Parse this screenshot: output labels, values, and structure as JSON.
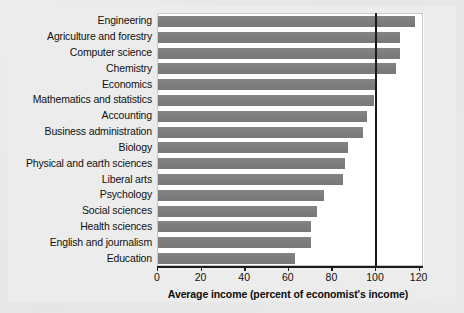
{
  "chart_data": {
    "type": "bar",
    "orientation": "horizontal",
    "title": "",
    "xlabel": "Average income (percent of economist's income)",
    "ylabel": "",
    "xlim": [
      0,
      126
    ],
    "xticks": [
      0,
      20,
      40,
      60,
      80,
      100,
      120
    ],
    "xtick_labels": [
      "0",
      "20",
      "40",
      "60",
      "80",
      "100",
      "120"
    ],
    "grid": false,
    "legend": null,
    "reference_line": {
      "value": 100,
      "color": "#1a1a1a",
      "orientation": "vertical"
    },
    "bar_color": "#7f7f7f",
    "plot_background": "#ffffff",
    "figure_background": "#ececec",
    "categories": [
      "Engineering",
      "Agriculture and forestry",
      "Computer science",
      "Chemistry",
      "Economics",
      "Mathematics and statistics",
      "Accounting",
      "Business administration",
      "Biology",
      "Physical and earth sciences",
      "Liberal arts",
      "Psychology",
      "Social sciences",
      "Health sciences",
      "English and journalism",
      "Education"
    ],
    "values": [
      118,
      111,
      111,
      109,
      100,
      99,
      96,
      94,
      87,
      86,
      85,
      76,
      73,
      70,
      70,
      63
    ]
  }
}
